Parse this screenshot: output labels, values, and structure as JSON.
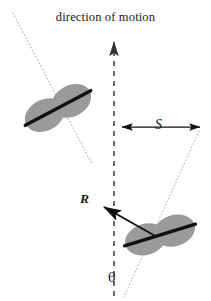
{
  "figure": {
    "type": "physics-diagram",
    "background_color": "#ffffff"
  },
  "labels": {
    "title": "direction of motion",
    "separation": "S",
    "resultant": "R",
    "angle": "θ"
  },
  "colors": {
    "particle_fill": "#9a9a9a",
    "particle_axis": "#111111",
    "motion_axis": "#333333",
    "trajectory_dotted": "#b4b4b4",
    "arrow": "#111111",
    "text": "#1a1a1a"
  },
  "geometry": {
    "motion_axis": {
      "x": 114,
      "y_top": 38,
      "y_bottom": 296,
      "style": "dashed",
      "arrowhead": "top"
    },
    "particles": [
      {
        "id": "upper-left-particle",
        "center_x": 58,
        "center_y": 108,
        "rotation_deg": 62,
        "length": 72,
        "width": 30
      },
      {
        "id": "lower-right-particle",
        "center_x": 160,
        "center_y": 235,
        "rotation_deg": 73,
        "length": 72,
        "width": 30
      }
    ],
    "trajectories": [
      {
        "id": "upper-trajectory",
        "x1": 13,
        "y1": 13,
        "x2": 92,
        "y2": 164,
        "style": "dotted"
      },
      {
        "id": "lower-trajectory",
        "x1": 199,
        "y1": 131,
        "x2": 124,
        "y2": 297,
        "style": "dotted"
      }
    ],
    "separation_arrow": {
      "x1": 121,
      "x2": 201,
      "y": 127,
      "double_headed": true
    },
    "resultant_arrow": {
      "x_tail": 156,
      "y_tail": 236,
      "x_head": 102,
      "y_head": 206
    },
    "angle_marker": {
      "x": 114,
      "y": 282,
      "between": [
        "motion_axis",
        "lower-trajectory"
      ]
    }
  }
}
